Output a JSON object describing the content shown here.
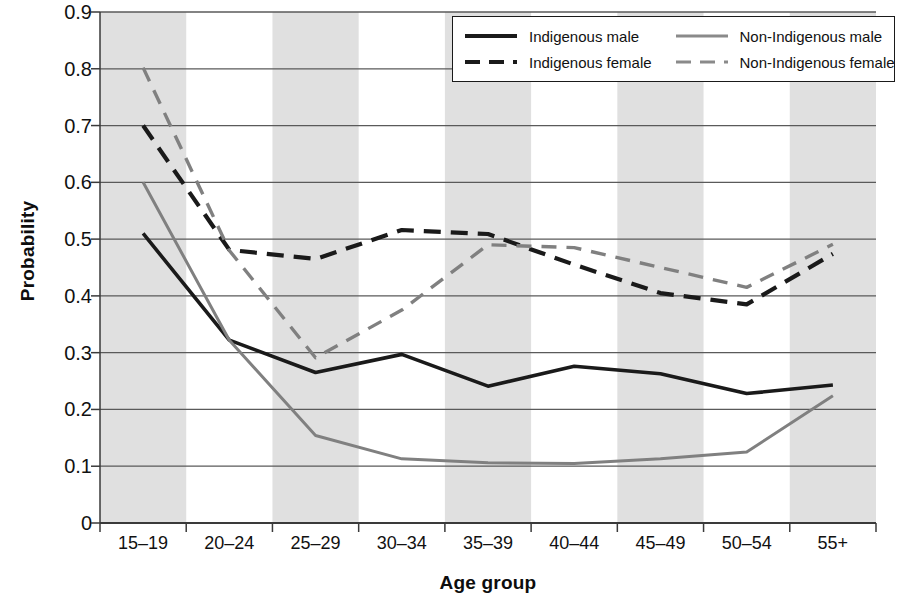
{
  "chart_data": {
    "type": "line",
    "title": "",
    "xlabel": "Age group",
    "ylabel": "Probability",
    "categories": [
      "15–19",
      "20–24",
      "25–29",
      "30–34",
      "35–39",
      "40–44",
      "45–49",
      "50–54",
      "55+"
    ],
    "ylim": [
      0,
      0.9
    ],
    "yticks": [
      0,
      0.1,
      0.2,
      0.3,
      0.4,
      0.5,
      0.6,
      0.7,
      0.8,
      0.9
    ],
    "ytick_labels": [
      "0",
      "0.1",
      "0.2",
      "0.3",
      "0.4",
      "0.5",
      "0.6",
      "0.7",
      "0.8",
      "0.9"
    ],
    "grid": "horizontal",
    "legend_position": "top-right",
    "banding": "alternating vertical grey bands on odd categories",
    "series": [
      {
        "name": "Indigenous male",
        "color": "#1a1a1a",
        "style": "solid",
        "values": [
          0.51,
          0.322,
          0.265,
          0.297,
          0.241,
          0.276,
          0.263,
          0.228,
          0.243
        ]
      },
      {
        "name": "Indigenous female",
        "color": "#1a1a1a",
        "style": "dashed",
        "values": [
          0.7,
          0.481,
          0.465,
          0.516,
          0.509,
          0.455,
          0.405,
          0.385,
          0.474
        ]
      },
      {
        "name": "Non-Indigenous male",
        "color": "#808080",
        "style": "solid",
        "values": [
          0.6,
          0.322,
          0.154,
          0.113,
          0.106,
          0.105,
          0.113,
          0.125,
          0.224
        ]
      },
      {
        "name": "Non-Indigenous female",
        "color": "#808080",
        "style": "dashed",
        "values": [
          0.802,
          0.48,
          0.291,
          0.375,
          0.49,
          0.485,
          0.45,
          0.415,
          0.491
        ]
      }
    ]
  },
  "legend": {
    "entries": [
      {
        "label": "Indigenous male",
        "swatch": "solid-black-line-icon"
      },
      {
        "label": "Non-Indigenous male",
        "swatch": "solid-grey-line-icon"
      },
      {
        "label": "Indigenous female",
        "swatch": "dashed-black-line-icon"
      },
      {
        "label": "Non-Indigenous female",
        "swatch": "dashed-grey-line-icon"
      }
    ]
  },
  "colors": {
    "indigenous": "#1a1a1a",
    "non_indigenous": "#808080",
    "band": "#e0e0e0",
    "gridline": "#5a5a5a",
    "axis": "#3a3a3a",
    "background": "#ffffff"
  }
}
